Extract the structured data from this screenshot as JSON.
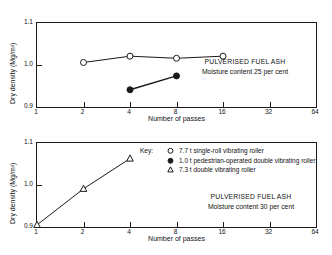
{
  "chart_data": [
    {
      "type": "line",
      "panel": "top",
      "title": "",
      "xlabel": "Number of passes",
      "ylabel": "Dry density (Mg/m³)",
      "xscale": "log2",
      "xticks": [
        1,
        2,
        4,
        8,
        16,
        32,
        64
      ],
      "xticklabels": [
        "1",
        "2",
        "4",
        "8",
        "16",
        "32",
        "64"
      ],
      "yticks": [
        0.9,
        1.0,
        1.1
      ],
      "yticklabels": [
        "0.9",
        "1.0",
        "1.1"
      ],
      "xlim": [
        1,
        64
      ],
      "ylim": [
        0.9,
        1.1
      ],
      "grid": false,
      "annotations": [
        "PULVERISED FUEL ASH",
        "Moisture content 25 per cent"
      ],
      "series": [
        {
          "name": "7.7 t single-roll vibrating roller",
          "marker": "open-circle",
          "x": [
            2,
            4,
            8,
            16
          ],
          "y": [
            1.006,
            1.021,
            1.016,
            1.021
          ]
        },
        {
          "name": "1.0 t pedestrian-operated double vibrating roller",
          "marker": "filled-circle",
          "x": [
            4,
            8
          ],
          "y": [
            0.941,
            0.974
          ]
        }
      ]
    },
    {
      "type": "line",
      "panel": "bottom",
      "title": "",
      "xlabel": "Number of passes",
      "ylabel": "Dry density (Mg/m³)",
      "xscale": "log2",
      "xticks": [
        1,
        2,
        4,
        8,
        16,
        32,
        64
      ],
      "xticklabels": [
        "1",
        "2",
        "4",
        "8",
        "16",
        "32",
        "64"
      ],
      "yticks": [
        0.9,
        1.0,
        1.1
      ],
      "yticklabels": [
        "0.9",
        "1.0",
        "1.1"
      ],
      "xlim": [
        1,
        64
      ],
      "ylim": [
        0.9,
        1.1
      ],
      "grid": false,
      "annotations": [
        "PULVERISED FUEL ASH",
        "Moisture content 30 per cent"
      ],
      "series": [
        {
          "name": "7.3 t double vibrating roller",
          "marker": "open-triangle",
          "x": [
            1,
            2,
            4
          ],
          "y": [
            0.905,
            0.991,
            1.063
          ]
        }
      ]
    }
  ],
  "legend": {
    "title": "Key:",
    "items": [
      {
        "marker": "open-circle",
        "label": "7.7 t single-roll vibrating roller"
      },
      {
        "marker": "filled-circle",
        "label": "1.0 t pedestrian-operated double vibrating roller"
      },
      {
        "marker": "open-triangle",
        "label": "7.3 t double vibrating roller"
      }
    ]
  },
  "colors": {
    "ink": "#1a1a1a",
    "background": "#ffffff"
  }
}
